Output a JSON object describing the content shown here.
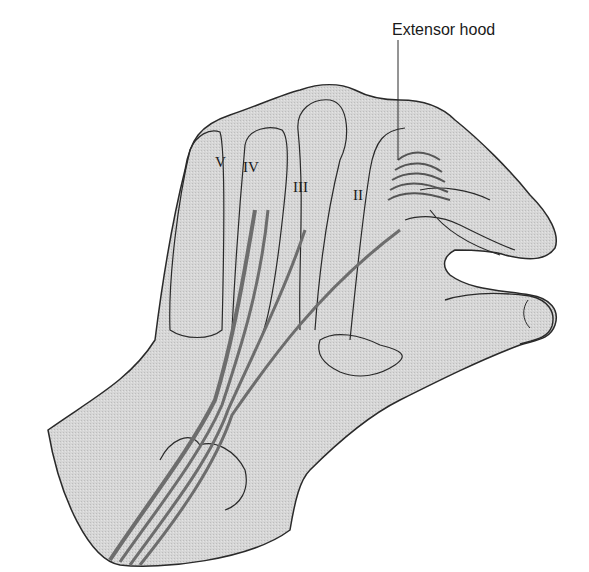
{
  "figure": {
    "colors": {
      "skin_fill": "#d4d4d4",
      "outline": "#2a2a2a",
      "tendon": "#7a7a7a",
      "background": "#ffffff"
    },
    "labels": {
      "extensor_hood": "Extensor hood",
      "digit_5": "V",
      "digit_4": "IV",
      "digit_3": "III",
      "digit_2": "II"
    }
  }
}
